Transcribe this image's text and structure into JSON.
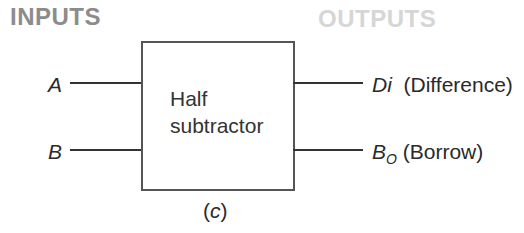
{
  "headers": {
    "inputs": "INPUTS",
    "outputs": "OUTPUTS"
  },
  "block": {
    "line1": "Half",
    "line2": "subtractor"
  },
  "inputs": [
    {
      "symbol": "A"
    },
    {
      "symbol": "B"
    }
  ],
  "outputs": [
    {
      "symbol": "Di",
      "description": "(Difference)"
    },
    {
      "symbol_main": "B",
      "symbol_sub": "O",
      "description": "(Borrow)"
    }
  ],
  "caption": {
    "open": "(",
    "letter": "c",
    "close": ")"
  }
}
